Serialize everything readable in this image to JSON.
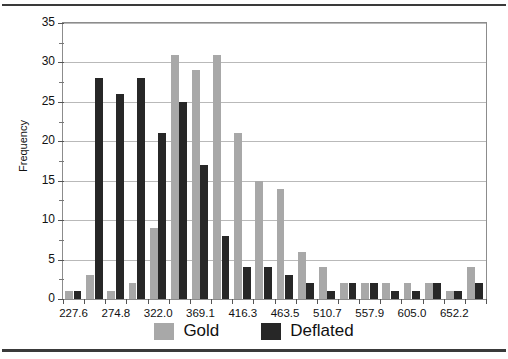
{
  "chart_data": {
    "type": "bar",
    "title": "",
    "subtitle": "",
    "xlabel": "",
    "ylabel": "Frequency",
    "grid": true,
    "legend_position": "bottom",
    "ylim": [
      0,
      35
    ],
    "ytick_step": 5,
    "yticks": [
      0,
      5,
      10,
      15,
      20,
      25,
      30,
      35
    ],
    "ytick_labels": [
      "0",
      "5",
      "10",
      "15",
      "20",
      "25",
      "30",
      "35"
    ],
    "y_minor_step": 2.5,
    "categories": [
      "227.6",
      "251.2",
      "274.8",
      "298.4",
      "322.0",
      "345.5",
      "369.1",
      "392.7",
      "416.3",
      "439.9",
      "463.5",
      "487.1",
      "510.7",
      "534.3",
      "557.9",
      "581.5",
      "605.0",
      "628.6",
      "652.2",
      "675.8"
    ],
    "xtick_labels": [
      "227.6",
      "274.8",
      "322.0",
      "369.1",
      "416.3",
      "463.5",
      "510.7",
      "557.9",
      "605.0",
      "652.2"
    ],
    "xtick_label_indices": [
      0,
      2,
      4,
      6,
      8,
      10,
      12,
      14,
      16,
      18
    ],
    "series": [
      {
        "name": "Gold",
        "color": "#a8a8a8",
        "values": [
          1,
          3,
          1,
          2,
          9,
          31,
          29,
          31,
          21,
          15,
          14,
          6,
          4,
          2,
          2,
          2,
          2,
          2,
          1,
          4
        ]
      },
      {
        "name": "Deflated",
        "color": "#272727",
        "values": [
          1,
          28,
          26,
          28,
          21,
          25,
          17,
          8,
          4,
          4,
          3,
          2,
          1,
          2,
          2,
          1,
          1,
          2,
          1,
          2
        ]
      }
    ]
  },
  "legend": {
    "items": [
      {
        "label": "Gold",
        "color": "#a8a8a8"
      },
      {
        "label": "Deflated",
        "color": "#272727"
      }
    ]
  }
}
